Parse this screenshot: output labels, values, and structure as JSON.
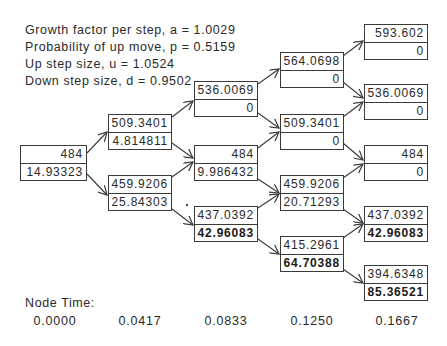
{
  "parameters": {
    "growth": "Growth factor per step, a = 1.0029",
    "prob": "Probability of up move, p = 0.5159",
    "up": "Up step size, u = 1.0524",
    "down": "Down step size, d = 0.9502"
  },
  "nodes": {
    "n0_0": {
      "price": "484",
      "value": "14.93323"
    },
    "n1_0": {
      "price": "509.3401",
      "value": "4.814811"
    },
    "n1_1": {
      "price": "459.9206",
      "value": "25.84303"
    },
    "n2_0": {
      "price": "536.0069",
      "value": "0"
    },
    "n2_1": {
      "price": "484",
      "value": "9.986432"
    },
    "n2_2": {
      "price": "437.0392",
      "value": "42.96083"
    },
    "n3_0": {
      "price": "564.0698",
      "value": "0"
    },
    "n3_1": {
      "price": "509.3401",
      "value": "0"
    },
    "n3_2": {
      "price": "459.9206",
      "value": "20.71293"
    },
    "n3_3": {
      "price": "415.2961",
      "value": "64.70388"
    },
    "n4_0": {
      "price": "593.602",
      "value": "0"
    },
    "n4_1": {
      "price": "536.0069",
      "value": "0"
    },
    "n4_2": {
      "price": "484",
      "value": "0"
    },
    "n4_3": {
      "price": "437.0392",
      "value": "42.96083"
    },
    "n4_4": {
      "price": "394.6348",
      "value": "85.36521"
    }
  },
  "node_time": {
    "label": "Node Time:",
    "values": [
      "0.0000",
      "0.0417",
      "0.0833",
      "0.1250",
      "0.1667"
    ]
  },
  "colors": {
    "line": "#3a3a3a",
    "text": "#2a2a2a",
    "background": "#ffffff"
  }
}
